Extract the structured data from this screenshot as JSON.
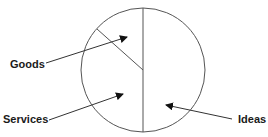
{
  "diagram": {
    "type": "pie-divided-circle",
    "segments": [
      {
        "id": "goods",
        "label": "Goods"
      },
      {
        "id": "services",
        "label": "Services"
      },
      {
        "id": "ideas",
        "label": "Ideas"
      }
    ],
    "colors": {
      "stroke": "#555555",
      "arrow": "#111111",
      "text": "#1a1a1a",
      "background": "#ffffff"
    }
  }
}
